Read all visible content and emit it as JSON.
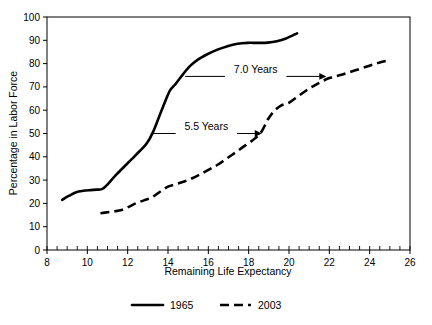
{
  "chart_data": {
    "type": "line",
    "title": "",
    "xlabel": "Remaining Life Expectancy",
    "ylabel": "Percentage in Labor Force",
    "xlim": [
      8,
      26
    ],
    "ylim": [
      0,
      100
    ],
    "xticks": [
      8,
      10,
      12,
      14,
      16,
      18,
      20,
      22,
      24,
      26
    ],
    "xtick_labels": [
      "8",
      "10",
      "12",
      "14",
      "16",
      "18",
      "20",
      "22",
      "24",
      "26"
    ],
    "x_minor_tick_step": 0.5,
    "yticks": [
      0,
      10,
      20,
      30,
      40,
      50,
      60,
      70,
      80,
      90,
      100
    ],
    "ytick_labels": [
      "0",
      "10",
      "20",
      "30",
      "40",
      "50",
      "60",
      "70",
      "80",
      "90",
      "100"
    ],
    "grid": false,
    "legend_position": "bottom",
    "series": [
      {
        "name": "1965",
        "style": "solid",
        "color": "#000000",
        "x": [
          8.75,
          9.1,
          9.45,
          9.8,
          10.15,
          10.45,
          10.75,
          11.05,
          11.4,
          11.8,
          12.2,
          12.6,
          12.95,
          13.25,
          13.55,
          13.85,
          14.1,
          14.4,
          14.75,
          15.1,
          15.5,
          15.95,
          16.45,
          16.95,
          17.45,
          17.95,
          18.45,
          18.95,
          19.4,
          19.85,
          20.4
        ],
        "y": [
          21.5,
          23.3,
          24.8,
          25.4,
          25.7,
          25.9,
          26.2,
          28.6,
          32.0,
          35.5,
          39.0,
          42.5,
          45.8,
          50.5,
          57.0,
          63.5,
          68.5,
          71.5,
          75.5,
          79.0,
          81.8,
          84.0,
          86.0,
          87.5,
          88.5,
          88.9,
          88.9,
          89.0,
          89.6,
          90.8,
          93.0
        ]
      },
      {
        "name": "2003",
        "style": "dashed",
        "color": "#000000",
        "x": [
          10.65,
          11.0,
          11.35,
          11.7,
          12.05,
          12.4,
          12.8,
          13.2,
          13.6,
          14.0,
          14.4,
          14.8,
          15.2,
          15.6,
          16.05,
          16.5,
          16.95,
          17.4,
          17.85,
          18.3,
          18.65,
          18.95,
          19.25,
          19.6,
          20.0,
          20.45,
          20.95,
          21.45,
          22.0,
          22.6,
          23.25,
          23.95,
          24.5,
          25.0
        ],
        "y": [
          15.8,
          16.2,
          16.6,
          17.2,
          18.5,
          20.0,
          21.3,
          22.6,
          25.0,
          27.2,
          28.3,
          29.4,
          30.8,
          32.5,
          34.6,
          36.8,
          39.5,
          42.2,
          45.0,
          47.8,
          51.0,
          56.0,
          59.5,
          62.0,
          63.2,
          66.0,
          69.0,
          71.5,
          73.8,
          75.2,
          77.0,
          79.0,
          80.5,
          81.5
        ]
      }
    ],
    "annotations": [
      {
        "label": "5.5 Years",
        "type": "double-ended-gap-arrow",
        "y": 50,
        "x_start": 13.15,
        "x_end": 18.65
      },
      {
        "label": "7.0 Years",
        "type": "double-ended-gap-arrow",
        "y": 74.5,
        "x_start": 14.85,
        "x_end": 21.85
      }
    ]
  },
  "legend": {
    "items": [
      {
        "label": "1965",
        "style": "solid"
      },
      {
        "label": "2003",
        "style": "dashed"
      }
    ]
  }
}
